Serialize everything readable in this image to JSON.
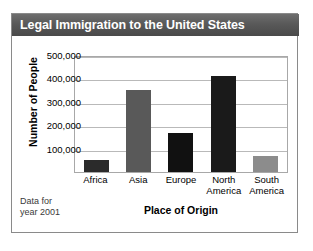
{
  "card": {
    "title": "Legal Immigration to the United States",
    "footnote_line1": "Data for",
    "footnote_line2": "year 2001"
  },
  "chart_data": {
    "type": "bar",
    "title": "Legal Immigration to the United States",
    "xlabel": "Place of Origin",
    "ylabel": "Number of People",
    "categories": [
      "Africa",
      "Asia",
      "Europe",
      "North America",
      "South America"
    ],
    "category_lines": [
      [
        "Africa"
      ],
      [
        "Asia"
      ],
      [
        "Europe"
      ],
      [
        "North",
        "America"
      ],
      [
        "South",
        "America"
      ]
    ],
    "values": [
      53000,
      350000,
      165000,
      410000,
      70000
    ],
    "bar_colors": [
      "#2b2b2b",
      "#595959",
      "#111111",
      "#1a1a1a",
      "#8c8c8c"
    ],
    "ylim": [
      0,
      500000
    ],
    "yticks": [
      100000,
      200000,
      300000,
      400000,
      500000
    ],
    "ytick_labels": [
      "100,000",
      "200,000",
      "300,000",
      "400,000",
      "500,000"
    ],
    "grid": true,
    "legend": false,
    "annotation": "Data for year 2001"
  },
  "colors": {
    "title_bar": "#555555",
    "title_text": "#ffffff",
    "grid": "#b9b9b9",
    "plot_border": "#a8a8a8",
    "card_border": "#8a8a8a"
  }
}
